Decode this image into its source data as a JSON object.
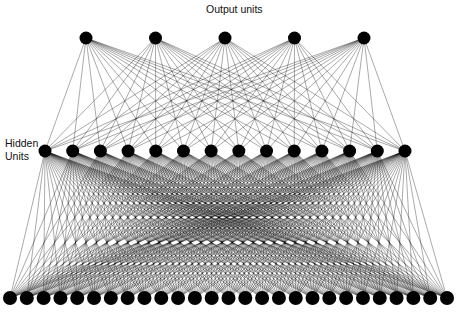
{
  "labels": {
    "output": "Output units",
    "hidden_line1": "Hidden",
    "hidden_line2": "Units"
  },
  "network": {
    "layers": [
      {
        "name": "output",
        "count": 5,
        "y": 38,
        "x_start": 86,
        "x_end": 364,
        "radius": 6.5
      },
      {
        "name": "hidden",
        "count": 14,
        "y": 151,
        "x_start": 45,
        "x_end": 405,
        "radius": 6.5
      },
      {
        "name": "input",
        "count": 27,
        "y": 298,
        "x_start": 10,
        "x_end": 447,
        "radius": 7
      }
    ],
    "connections": "fully-connected between adjacent layers",
    "node_color": "#000000",
    "edge_color": "#000000"
  }
}
